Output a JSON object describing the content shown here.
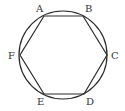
{
  "diagram": {
    "stroke_color": "#2a2a2a",
    "label_color": "#333333",
    "circle": {
      "cx": 63,
      "cy": 55,
      "r": 44
    },
    "vertices": [
      {
        "name": "A",
        "x": 44,
        "y": 16,
        "label_x": 36,
        "label_y": 12
      },
      {
        "name": "B",
        "x": 83,
        "y": 16,
        "label_x": 85,
        "label_y": 12
      },
      {
        "name": "C",
        "x": 107,
        "y": 55,
        "label_x": 111,
        "label_y": 59
      },
      {
        "name": "D",
        "x": 84,
        "y": 94,
        "label_x": 86,
        "label_y": 105
      },
      {
        "name": "E",
        "x": 44,
        "y": 94,
        "label_x": 37,
        "label_y": 105
      },
      {
        "name": "F",
        "x": 20,
        "y": 55,
        "label_x": 8,
        "label_y": 59
      }
    ],
    "labels": {
      "A": "A",
      "B": "B",
      "C": "C",
      "D": "D",
      "E": "E",
      "F": "F"
    }
  }
}
